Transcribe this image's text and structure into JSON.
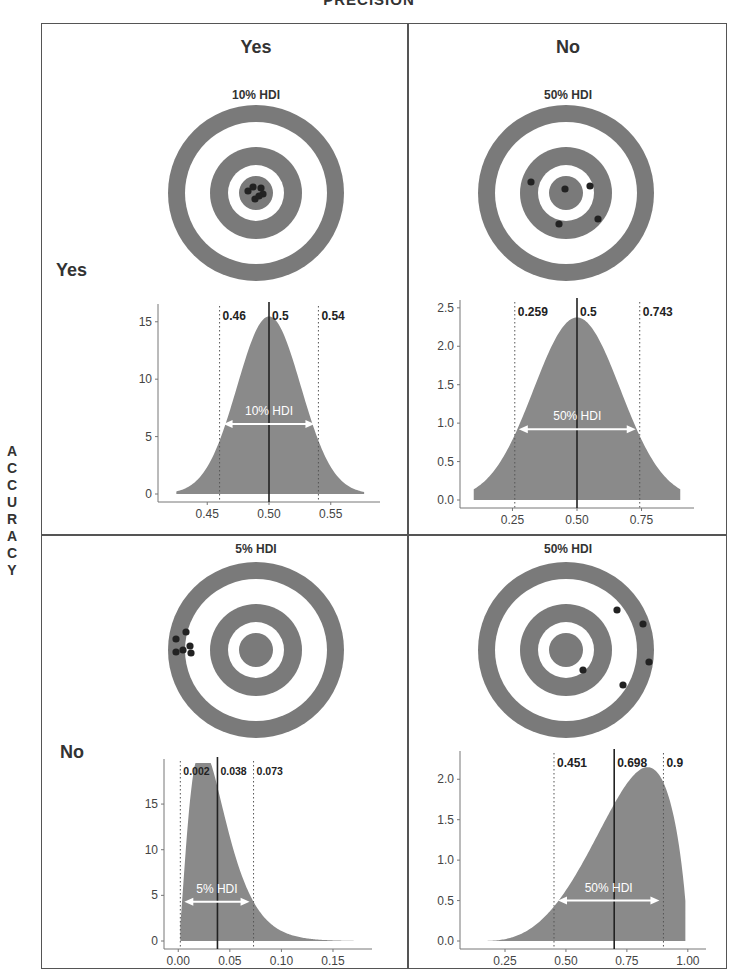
{
  "title": "PRECISION",
  "row_axis_label": "ACCURACY",
  "row_axis_letters": [
    "A",
    "C",
    "C",
    "U",
    "R",
    "A",
    "C",
    "Y"
  ],
  "columns": [
    {
      "label": "Yes"
    },
    {
      "label": "No"
    }
  ],
  "rows": [
    {
      "label": "Yes"
    },
    {
      "label": "No"
    }
  ],
  "colors": {
    "ring": "#7a7a7a",
    "fill": "#8a8a8a",
    "shot": "#222222",
    "frame": "#555555"
  },
  "panels": [
    {
      "id": "acc-yes-prec-yes",
      "target_label": "10% HDI",
      "hdi_label": "10% HDI",
      "shots": [
        [
          -8,
          -2
        ],
        [
          -3,
          -6
        ],
        [
          5,
          -5
        ],
        [
          7,
          1
        ],
        [
          -1,
          6
        ],
        [
          3,
          3
        ]
      ]
    },
    {
      "id": "acc-yes-prec-no",
      "target_label": "50% HDI",
      "hdi_label": "50% HDI",
      "shots": [
        [
          -35,
          -11
        ],
        [
          -1,
          -4
        ],
        [
          24,
          -7
        ],
        [
          32,
          26
        ],
        [
          -7,
          31
        ]
      ]
    },
    {
      "id": "acc-no-prec-yes",
      "target_label": "5% HDI",
      "hdi_label": "5% HDI",
      "shots": [
        [
          -80,
          -11
        ],
        [
          -70,
          -18
        ],
        [
          -66,
          -4
        ],
        [
          -73,
          0
        ],
        [
          -65,
          3
        ],
        [
          -80,
          2
        ]
      ]
    },
    {
      "id": "acc-no-prec-no",
      "target_label": "50% HDI",
      "hdi_label": "50% HDI",
      "shots": [
        [
          51,
          -40
        ],
        [
          77,
          -26
        ],
        [
          83,
          12
        ],
        [
          57,
          35
        ],
        [
          17,
          20
        ]
      ]
    }
  ],
  "chart_data": [
    {
      "type": "area",
      "title": "Accuracy Yes / Precision Yes",
      "hdi": "10% HDI",
      "x_ticks": [
        "0.45",
        "0.50",
        "0.55"
      ],
      "y_ticks": [
        "0",
        "5",
        "10",
        "15"
      ],
      "xlim": [
        0.415,
        0.585
      ],
      "ylim": [
        0,
        16.2
      ],
      "lower": 0.46,
      "mode": 0.5,
      "upper": 0.54,
      "lower_label": "0.46",
      "mode_label": "0.5",
      "upper_label": "0.54",
      "distribution": {
        "kind": "normal",
        "mean": 0.5,
        "sd": 0.0258
      },
      "arrow_y": 6.1
    },
    {
      "type": "area",
      "title": "Accuracy Yes / Precision No",
      "hdi": "50% HDI",
      "x_ticks": [
        "0.25",
        "0.50",
        "0.75"
      ],
      "y_ticks": [
        "0.0",
        "0.5",
        "1.0",
        "1.5",
        "2.0",
        "2.5"
      ],
      "xlim": [
        0.07,
        0.93
      ],
      "ylim": [
        0,
        2.55
      ],
      "lower": 0.259,
      "mode": 0.5,
      "upper": 0.743,
      "lower_label": "0.259",
      "mode_label": "0.5",
      "upper_label": "0.743",
      "distribution": {
        "kind": "normal",
        "mean": 0.5,
        "sd": 0.168,
        "range": [
          0.1,
          0.9
        ]
      },
      "arrow_y": 0.92
    },
    {
      "type": "area",
      "title": "Accuracy No / Precision Yes",
      "hdi": "5% HDI",
      "x_ticks": [
        "0.00",
        "0.05",
        "0.10",
        "0.15"
      ],
      "y_ticks": [
        "0",
        "5",
        "10",
        "15"
      ],
      "xlim": [
        -0.008,
        0.182
      ],
      "ylim": [
        0,
        19.5
      ],
      "lower": 0.002,
      "mode": 0.038,
      "upper": 0.073,
      "lower_label": "0.002",
      "mode_label": "0.038",
      "upper_label": "0.073",
      "distribution": {
        "kind": "gamma",
        "shape": 2.6,
        "scale": 0.0145,
        "range": [
          0.002,
          0.17
        ]
      },
      "arrow_y": 4.3
    },
    {
      "type": "area",
      "title": "Accuracy No / Precision No",
      "hdi": "50% HDI",
      "x_ticks": [
        "0.25",
        "0.50",
        "0.75",
        "1.00"
      ],
      "y_ticks": [
        "0.0",
        "0.5",
        "1.0",
        "1.5",
        "2.0"
      ],
      "xlim": [
        0.09,
        1.05
      ],
      "ylim": [
        0,
        2.3
      ],
      "lower": 0.451,
      "mode": 0.698,
      "upper": 0.9,
      "lower_label": "0.451",
      "mode_label": "0.698",
      "upper_label": "0.9",
      "distribution": {
        "kind": "beta-like",
        "range": [
          0.15,
          0.99
        ]
      },
      "arrow_y": 0.5
    }
  ]
}
